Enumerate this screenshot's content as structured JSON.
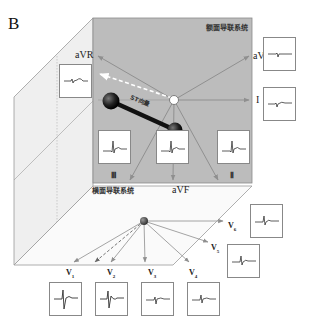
{
  "figure": {
    "panel_label": "B",
    "frontal_plane_label": "额面导联系统",
    "horizontal_plane_label": "横面导联系统",
    "st_vector_label": "ST向量"
  },
  "frontal_leads": {
    "aVR": "aVR",
    "aVL": "aVL",
    "I": "I",
    "III": "Ⅲ",
    "aVF": "aVF",
    "II": "Ⅱ"
  },
  "precordial_leads": {
    "V1": "V",
    "V1_sub": "1",
    "V2": "V",
    "V2_sub": "2",
    "V3": "V",
    "V3_sub": "3",
    "V4": "V",
    "V4_sub": "4",
    "V5": "V",
    "V5_sub": "5",
    "V6": "V",
    "V6_sub": "6"
  },
  "ecg_boxes": [
    {
      "lead": "aVR",
      "morphology": "small inverted / ST depression"
    },
    {
      "lead": "aVL",
      "morphology": "small negative deflection"
    },
    {
      "lead": "I",
      "morphology": "small biphasic"
    },
    {
      "lead": "III",
      "morphology": "upright QRS, ST elevation"
    },
    {
      "lead": "aVF",
      "morphology": "upright QRS, ST elevation"
    },
    {
      "lead": "II",
      "morphology": "upright QRS, ST elevation"
    },
    {
      "lead": "V1",
      "morphology": "large rS, ST elevation"
    },
    {
      "lead": "V2",
      "morphology": "RS, ST elevation"
    },
    {
      "lead": "V3",
      "morphology": "small QRS"
    },
    {
      "lead": "V4",
      "morphology": "small QRS"
    },
    {
      "lead": "V5",
      "morphology": "small QRS"
    },
    {
      "lead": "V6",
      "morphology": "small QRS"
    }
  ],
  "colors": {
    "frontal_plane_fill": "#b9b9b9",
    "side_panel_fill": "#ececec",
    "axis_line": "#8a8a8a",
    "vector_dark": "#1a1a1a",
    "dashed_arrow": "#ffffff"
  }
}
